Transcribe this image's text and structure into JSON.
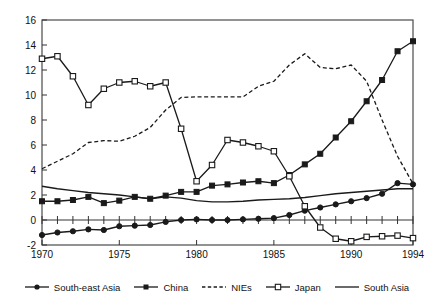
{
  "chart_data": {
    "type": "line",
    "title": "",
    "subtitle": "",
    "xlabel": "",
    "ylabel": "",
    "xlim": [
      1970,
      1994
    ],
    "ylim": [
      -2,
      16
    ],
    "yticks": [
      -2,
      0,
      2,
      4,
      6,
      8,
      10,
      12,
      14,
      16
    ],
    "xticks": [
      1970,
      1975,
      1980,
      1985,
      1990,
      1994
    ],
    "xtick_labels": [
      "1970",
      "1975",
      "1980",
      "1985",
      "1990",
      "1994"
    ],
    "ytick_labels": [
      "-2",
      "0",
      "2",
      "4",
      "6",
      "8",
      "10",
      "12",
      "14",
      "16"
    ],
    "grid": false,
    "legend_position": "bottom",
    "x": [
      1970,
      1971,
      1972,
      1973,
      1974,
      1975,
      1976,
      1977,
      1978,
      1979,
      1980,
      1981,
      1982,
      1983,
      1984,
      1985,
      1986,
      1987,
      1988,
      1989,
      1990,
      1991,
      1992,
      1993,
      1994
    ],
    "series": [
      {
        "name": "South-east Asia",
        "marker": "filled-circle",
        "linestyle": "solid",
        "color": "#1a1a1a",
        "values": [
          -1.2,
          -1.0,
          -0.9,
          -0.75,
          -0.8,
          -0.5,
          -0.45,
          -0.4,
          -0.15,
          0.0,
          0.05,
          0.0,
          0.0,
          0.05,
          0.1,
          0.15,
          0.4,
          0.75,
          1.0,
          1.25,
          1.5,
          1.75,
          2.1,
          2.95,
          2.85
        ]
      },
      {
        "name": "China",
        "marker": "filled-square",
        "linestyle": "solid",
        "color": "#1a1a1a",
        "values": [
          1.5,
          1.5,
          1.6,
          1.85,
          1.35,
          1.55,
          1.85,
          1.7,
          1.95,
          2.25,
          2.25,
          2.75,
          2.85,
          3.0,
          3.1,
          2.95,
          3.6,
          4.45,
          5.3,
          6.6,
          7.9,
          9.5,
          11.2,
          13.5,
          14.3
        ]
      },
      {
        "name": "NIEs",
        "marker": "none",
        "linestyle": "dashed",
        "color": "#1a1a1a",
        "values": [
          4.1,
          4.7,
          5.3,
          6.2,
          6.35,
          6.3,
          6.7,
          7.4,
          8.8,
          9.8,
          9.85,
          9.85,
          9.85,
          9.85,
          10.7,
          11.1,
          12.4,
          13.3,
          12.2,
          12.1,
          12.4,
          11.1,
          8.0,
          5.1,
          2.9
        ]
      },
      {
        "name": "Japan",
        "marker": "open-square",
        "linestyle": "solid",
        "color": "#1a1a1a",
        "values": [
          12.9,
          13.1,
          11.5,
          9.2,
          10.5,
          11.0,
          11.1,
          10.7,
          11.0,
          7.3,
          3.1,
          4.4,
          6.4,
          6.2,
          5.9,
          5.5,
          3.5,
          1.1,
          -0.6,
          -1.5,
          -1.7,
          -1.35,
          -1.3,
          -1.25,
          -1.45
        ]
      },
      {
        "name": "South Asia",
        "marker": "none",
        "linestyle": "solid",
        "color": "#1a1a1a",
        "values": [
          2.7,
          2.5,
          2.35,
          2.2,
          2.1,
          2.0,
          1.85,
          1.7,
          1.85,
          1.75,
          1.55,
          1.45,
          1.45,
          1.5,
          1.6,
          1.65,
          1.7,
          1.8,
          1.95,
          2.1,
          2.2,
          2.3,
          2.4,
          2.5,
          2.5
        ]
      }
    ]
  },
  "legend": {
    "items": [
      {
        "label": "South-east Asia",
        "key": "filled-circle-solid"
      },
      {
        "label": "China",
        "key": "filled-square-solid"
      },
      {
        "label": "NIEs",
        "key": "dashed"
      },
      {
        "label": "Japan",
        "key": "open-square-solid"
      },
      {
        "label": "South Asia",
        "key": "plain-solid"
      }
    ]
  }
}
